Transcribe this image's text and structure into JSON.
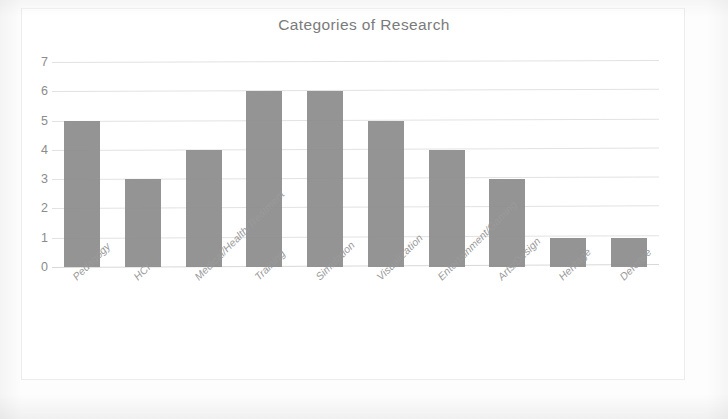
{
  "chart_data": {
    "type": "bar",
    "title": "Categories of Research",
    "xlabel": "",
    "ylabel": "",
    "categories": [
      "Pedagogy",
      "HCI",
      "Medical/Health/Treatment",
      "Training",
      "Simulation",
      "Visualization",
      "Entertainment/Gaming",
      "Arts/Design",
      "Heritage",
      "Defense"
    ],
    "values": [
      5,
      3,
      4,
      6,
      6,
      5,
      4,
      3,
      1,
      1
    ],
    "ylim": [
      0,
      7
    ],
    "yticks": [
      0,
      1,
      2,
      3,
      4,
      5,
      6,
      7
    ],
    "ytick_labels": [
      "0",
      "1",
      "2",
      "3",
      "4",
      "5",
      "6",
      "7"
    ],
    "grid": true,
    "legend": false,
    "legend_position": "none",
    "bar_color": "#8c8c8c",
    "gridline_color": "#e2e2e2",
    "title_color": "#7b7b7b",
    "tick_label_color": "#8b8b8b",
    "x_label_color": "#9a9a9a",
    "background_color": "#ffffff"
  }
}
